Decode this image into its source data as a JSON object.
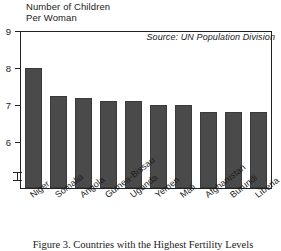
{
  "figure": {
    "axis_title_line1": "Number of Children",
    "axis_title_line2": "Per Woman",
    "source_note": "Source: UN Population Division",
    "caption": "Figure 3. Countries with the Highest Fertility Levels",
    "bar_color": "#4a4a4a",
    "frame_color": "#222222",
    "background_color": "#ffffff"
  },
  "chart_data": {
    "type": "bar",
    "xlabel": "",
    "ylabel": "Number of Children Per Woman",
    "ylim": [
      5.55,
      9
    ],
    "axis_break": true,
    "grid": false,
    "legend": "none",
    "yticks": [
      9,
      8,
      7,
      6
    ],
    "ytick_labels": [
      "9",
      "8",
      "7",
      "6"
    ],
    "categories": [
      "Niger",
      "Somalia",
      "Angola",
      "Guinea-Bissau",
      "Uganda",
      "Yemen",
      "Mali",
      "Afghanistan",
      "Burundi",
      "Liberia"
    ],
    "values": [
      8.0,
      7.25,
      7.2,
      7.1,
      7.1,
      7.0,
      7.0,
      6.8,
      6.8,
      6.8
    ],
    "annotations": [
      "Source: UN Population Division"
    ]
  }
}
